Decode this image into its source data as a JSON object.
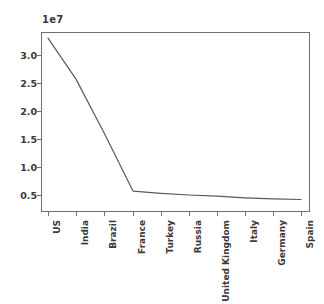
{
  "figure": {
    "offset_text": "1e7",
    "background_color": "#ffffff",
    "frame_color": "#6f6f6f",
    "line_color": "#5a5a5a"
  },
  "axes": {
    "y_ticks": [
      "0.5",
      "1.0",
      "1.5",
      "2.0",
      "2.5",
      "3.0"
    ],
    "y_tick_values": [
      5000000,
      10000000,
      15000000,
      20000000,
      25000000,
      30000000
    ],
    "x_ticks": [
      "US",
      "India",
      "Brazil",
      "France",
      "Turkey",
      "Russia",
      "United Kingdom",
      "Italy",
      "Germany",
      "Spain"
    ]
  },
  "chart_data": {
    "type": "line",
    "title": "",
    "xlabel": "",
    "ylabel": "",
    "offset_text": "1e7",
    "categories": [
      "US",
      "India",
      "Brazil",
      "France",
      "Turkey",
      "Russia",
      "United Kingdom",
      "Italy",
      "Germany",
      "Spain"
    ],
    "values": [
      33000000,
      25700000,
      16100000,
      5700000,
      5300000,
      5000000,
      4800000,
      4500000,
      4300000,
      4200000
    ],
    "values_scaled_1e7": [
      3.3,
      2.57,
      1.61,
      0.57,
      0.53,
      0.5,
      0.48,
      0.45,
      0.43,
      0.42
    ],
    "series": [
      {
        "name": "",
        "values": [
          33000000,
          25700000,
          16100000,
          5700000,
          5300000,
          5000000,
          4800000,
          4500000,
          4300000,
          4200000
        ]
      }
    ],
    "ylim": [
      3000000,
      33800000
    ],
    "ytick_values": [
      5000000,
      10000000,
      15000000,
      20000000,
      25000000,
      30000000
    ],
    "ytick_labels": [
      "0.5",
      "1.0",
      "1.5",
      "2.0",
      "2.5",
      "3.0"
    ],
    "grid": false,
    "legend": false,
    "legend_position": "none",
    "marker": "none",
    "line_color": "#5a5a5a",
    "line_width": 1.2
  }
}
